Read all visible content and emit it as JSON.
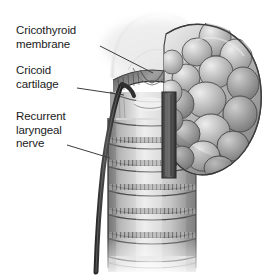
{
  "figure": {
    "kind": "anatomical-illustration",
    "style": "grayscale pen-and-wash medical illustration",
    "width": 273,
    "height": 277,
    "background_color": "#ffffff"
  },
  "labels": [
    {
      "id": "cricothyroid-membrane",
      "text": "Cricothyroid\nmembrane",
      "line1": "Cricothyroid",
      "line2": "membrane",
      "leader": {
        "x1": 100,
        "y1": 47,
        "x2": 152,
        "y2": 73
      }
    },
    {
      "id": "cricoid-cartilage",
      "text": "Cricoid\ncartilage",
      "line1": "Cricoid",
      "line2": "cartilage",
      "leader": {
        "x1": 77,
        "y1": 88,
        "x2": 122,
        "y2": 95
      }
    },
    {
      "id": "recurrent-laryngeal-nerve",
      "text": "Recurrent\nlaryngeal\nnerve",
      "line1": "Recurrent",
      "line2": "laryngeal",
      "line3": "nerve",
      "leader": {
        "x1": 68,
        "y1": 145,
        "x2": 107,
        "y2": 157
      }
    }
  ],
  "structures": {
    "thyroid_cartilage": {
      "name": "thyroid cartilage",
      "tone": "#f0f0f0"
    },
    "cricothyroid_membrane": {
      "name": "cricothyroid membrane",
      "tone": "#8d8d8d"
    },
    "cricoid_cartilage": {
      "name": "cricoid cartilage",
      "tone": "#b4b4b4"
    },
    "trachea": {
      "name": "trachea",
      "ring_count": 7,
      "tone": "#d9d9d9"
    },
    "thyroid_gland": {
      "name": "thyroid gland lobe",
      "tone": "#b9b9b9",
      "lobule_count": 18
    },
    "recurrent_laryngeal_nerve": {
      "name": "recurrent laryngeal nerve",
      "tone": "#3a3a3a"
    }
  },
  "colors": {
    "ink": "#1b1b1b",
    "leader_line": "#3c3c3c",
    "shade_dark": "#5a5a5a",
    "shade_mid": "#9b9b9b",
    "shade_light": "#e4e4e4"
  }
}
